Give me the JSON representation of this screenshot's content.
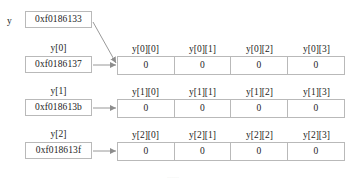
{
  "diagram": {
    "root_variable_label": "y",
    "root_pointer_value": "0xf0186133",
    "cell_value": "0",
    "colors": {
      "border": "#b9b9b9",
      "text": "#1c1c1c",
      "background": "#ffffff",
      "arrow": "#8d8d8d"
    },
    "rows": [
      {
        "pointer_label": "y[0]",
        "pointer_value": "0xf0186137",
        "headers": [
          "y[0][0]",
          "y[0][1]",
          "y[0][2]",
          "y[0][3]"
        ],
        "values": [
          "0",
          "0",
          "0",
          "0"
        ]
      },
      {
        "pointer_label": "y[1]",
        "pointer_value": "0xf018613b",
        "headers": [
          "y[1][0]",
          "y[1][1]",
          "y[1][2]",
          "y[1][3]"
        ],
        "values": [
          "0",
          "0",
          "0",
          "0"
        ]
      },
      {
        "pointer_label": "y[2]",
        "pointer_value": "0xf018613f",
        "headers": [
          "y[2][0]",
          "y[2][1]",
          "y[2][2]",
          "y[2][3]"
        ],
        "values": [
          "0",
          "0",
          "0",
          "0"
        ]
      }
    ],
    "caption_partial": "......"
  }
}
